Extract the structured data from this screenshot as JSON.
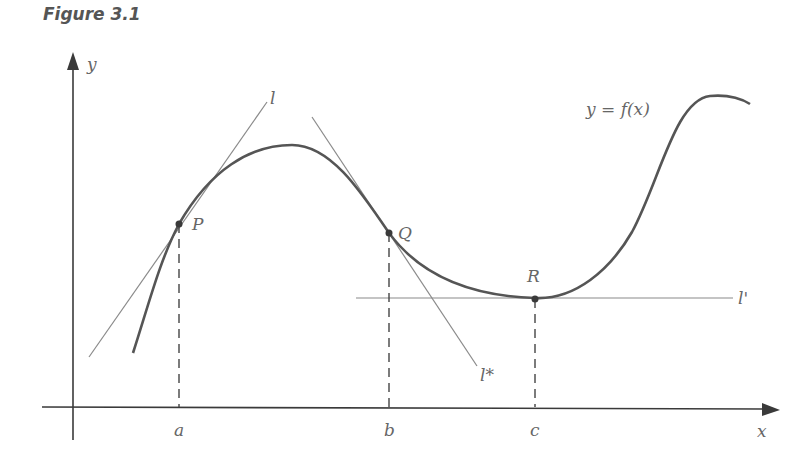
{
  "figure": {
    "title": "Figure 3.1",
    "curve_label": "y = f(x)"
  },
  "axes": {
    "x_label": "x",
    "y_label": "y"
  },
  "points": [
    {
      "name": "P",
      "x_tick": "a"
    },
    {
      "name": "Q",
      "x_tick": "b"
    },
    {
      "name": "R",
      "x_tick": "c"
    }
  ],
  "tangent_lines": [
    {
      "name": "l",
      "at": "P"
    },
    {
      "name": "l*",
      "at": "Q"
    },
    {
      "name": "l'",
      "at": "R"
    }
  ],
  "colors": {
    "curve": "#555555",
    "tangent": "#8a8a8a",
    "axis": "#3a3a3a",
    "text": "#666666"
  }
}
